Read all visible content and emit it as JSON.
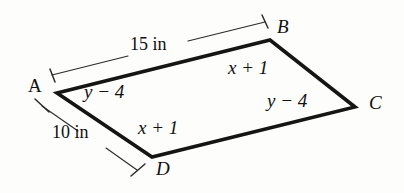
{
  "figure": {
    "kind": "parallelogram-diagram",
    "shape_name": "ABCD",
    "vertices": [
      {
        "id": "A",
        "label": "A",
        "x": 57,
        "y": 93,
        "italic": false
      },
      {
        "id": "B",
        "label": "B",
        "x": 270,
        "y": 40,
        "italic": true
      },
      {
        "id": "C",
        "label": "C",
        "x": 355,
        "y": 107,
        "italic": true
      },
      {
        "id": "D",
        "label": "D",
        "x": 152,
        "y": 157,
        "italic": true
      }
    ],
    "edge_labels": {
      "ab": "x + 1",
      "dc": "x + 1",
      "ad": "y − 4",
      "bc": "y − 4"
    },
    "dimensions": {
      "top": "15 in",
      "left": "10 in"
    },
    "colors": {
      "background": "#fdfdfb",
      "edge_stroke": "#151515",
      "dimension_stroke": "#2b2b2b",
      "text": "#111111"
    }
  }
}
